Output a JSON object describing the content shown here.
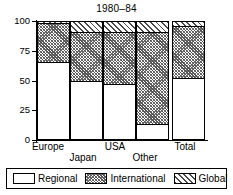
{
  "chart_data": {
    "type": "bar",
    "title": "1980–84",
    "xlabel": "",
    "ylabel": "",
    "ylim": [
      0,
      100
    ],
    "yticks": [
      0,
      25,
      50,
      75,
      100
    ],
    "ytick_labels": [
      "0",
      "25",
      "50",
      "75",
      "100"
    ],
    "grid": false,
    "stacked": true,
    "legend_position": "bottom",
    "categories": [
      "Europe",
      "Japan",
      "USA",
      "Other",
      "Total"
    ],
    "series": [
      {
        "name": "Regional",
        "values": [
          65,
          49,
          47,
          13,
          52
        ]
      },
      {
        "name": "International",
        "values": [
          33,
          42,
          44,
          78,
          44
        ]
      },
      {
        "name": "Global",
        "values": [
          2,
          9,
          9,
          9,
          4
        ]
      }
    ],
    "cumulative_tops": {
      "Europe": [
        65,
        98,
        100
      ],
      "Japan": [
        49,
        91,
        100
      ],
      "USA": [
        47,
        91,
        100
      ],
      "Other": [
        13,
        91,
        100
      ],
      "Total": [
        52,
        96,
        100
      ]
    }
  },
  "legend": {
    "items": [
      {
        "label": "Regional",
        "key": "regional"
      },
      {
        "label": "International",
        "key": "international"
      },
      {
        "label": "Global",
        "key": "global"
      }
    ]
  }
}
